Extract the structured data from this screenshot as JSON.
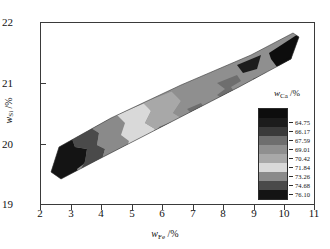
{
  "chart_data": {
    "type": "heatmap",
    "title": "",
    "xlabel": "w_Fe /%",
    "ylabel": "w_Si /%",
    "xlabel_var": "w",
    "xlabel_sub": "Fe",
    "xlabel_unit": "/%",
    "ylabel_var": "w",
    "ylabel_sub": "Si",
    "ylabel_unit": "/%",
    "xlim": [
      2,
      11
    ],
    "ylim": [
      19,
      22
    ],
    "xticks": [
      "2",
      "3",
      "4",
      "5",
      "6",
      "7",
      "8",
      "9",
      "10",
      "11"
    ],
    "yticks": [
      "19",
      "20",
      "21",
      "22"
    ],
    "grid": false,
    "legend_position": "inside-right",
    "colorbar": {
      "title_var": "w",
      "title_sub": "Ca",
      "title_unit": "/%",
      "title": "w_Ca /%",
      "levels": [
        "64.75",
        "66.17",
        "67.59",
        "69.01",
        "70.42",
        "71.84",
        "73.26",
        "74.68",
        "76.10"
      ],
      "colors": [
        "#0d0d0d",
        "#1c1c1c",
        "#3a3a3a",
        "#6e6e6e",
        "#8f8f8f",
        "#a8a8a8",
        "#d9d9d9",
        "#8a8a8a",
        "#4a4a4a",
        "#141414"
      ]
    },
    "region_description": "Elongated band of filled contours running diagonally from lower-left (w_Fe=2.3, w_Si=19.6) to upper-right (w_Fe=10.2, w_Si=21.7)"
  },
  "axes": {
    "x_ticks": [
      {
        "label": "2",
        "value": 2
      },
      {
        "label": "3",
        "value": 3
      },
      {
        "label": "4",
        "value": 4
      },
      {
        "label": "5",
        "value": 5
      },
      {
        "label": "6",
        "value": 6
      },
      {
        "label": "7",
        "value": 7
      },
      {
        "label": "8",
        "value": 8
      },
      {
        "label": "9",
        "value": 9
      },
      {
        "label": "10",
        "value": 10
      },
      {
        "label": "11",
        "value": 11
      }
    ],
    "y_ticks": [
      {
        "label": "22",
        "value": 22
      },
      {
        "label": "21",
        "value": 21
      },
      {
        "label": "20",
        "value": 20
      },
      {
        "label": "19",
        "value": 19
      }
    ]
  }
}
